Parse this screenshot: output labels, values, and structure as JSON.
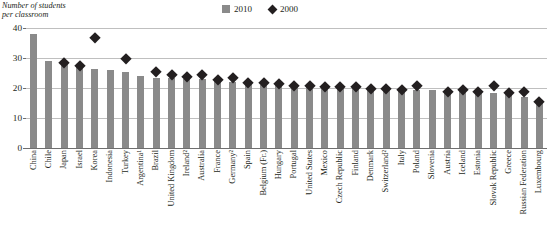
{
  "axis_title": "Number of students\nper classroom",
  "legend": [
    {
      "label": "2010",
      "marker": "square-swatch-icon",
      "color": "#8a8a8a"
    },
    {
      "label": "2000",
      "marker": "diamond-swatch-icon",
      "color": "#231f20"
    }
  ],
  "chart_data": {
    "type": "bar",
    "title": "Number of students per classroom",
    "xlabel": "",
    "ylabel": "Number of students per classroom",
    "ylim": [
      0,
      40
    ],
    "yticks": [
      "0",
      "10",
      "20",
      "30",
      "40"
    ],
    "ytick_values": [
      0,
      10,
      20,
      30,
      40
    ],
    "grid": true,
    "legend_position": "top-right",
    "categories": [
      "China",
      "Chile",
      "Japan",
      "Israel",
      "Korea",
      "Indonesia",
      "Turkey",
      "Argentina¹",
      "Brazil",
      "United Kingdom",
      "Ireland²",
      "Australia",
      "France",
      "Germany²",
      "Spain",
      "Belgium (Fr.)",
      "Hungary",
      "Portugal",
      "United States",
      "Mexico",
      "Czech Republic",
      "Finland",
      "Denmark",
      "Switzerland²",
      "Italy",
      "Poland",
      "Slovenia",
      "Austria",
      "Iceland",
      "Estonia",
      "Slovak Republic",
      "Greece",
      "Russian Federation",
      "Luxembourg"
    ],
    "series": [
      {
        "name": "2010",
        "marker": "bar",
        "color": "#8a8a8a",
        "values": [
          38,
          29,
          28,
          27,
          26.5,
          26,
          25.5,
          24,
          23.5,
          23.5,
          23,
          23,
          22.5,
          22,
          21.5,
          21,
          21,
          21,
          20.5,
          20.5,
          20.5,
          20,
          20,
          19.5,
          19.5,
          19.5,
          19.5,
          19,
          19,
          18.5,
          18.5,
          18,
          17,
          16
        ]
      },
      {
        "name": "2000",
        "marker": "diamond",
        "color": "#231f20",
        "values": [
          null,
          null,
          28.5,
          27.5,
          37,
          null,
          30,
          null,
          25.5,
          24.5,
          24,
          24.5,
          23,
          23.5,
          22,
          22,
          21.5,
          21,
          21,
          20.5,
          20.5,
          20.5,
          20,
          20,
          19.5,
          21,
          null,
          19,
          19.5,
          19,
          21,
          18.5,
          19,
          15.5
        ]
      }
    ]
  }
}
